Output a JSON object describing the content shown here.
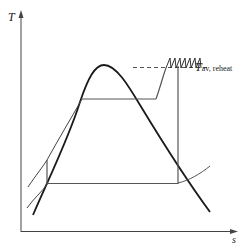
{
  "diagram": {
    "type": "T-s diagram (Rankine cycle with reheat)",
    "axes": {
      "y_label": "T",
      "x_label": "s"
    },
    "annotation": {
      "symbol": "T",
      "subscript": "av, reheat"
    },
    "colors": {
      "dome": "#1a1a1a",
      "cycle": "#555555",
      "axis": "#444444"
    }
  }
}
